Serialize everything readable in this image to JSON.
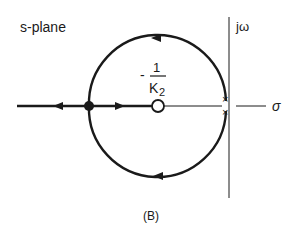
{
  "diagram": {
    "title_label": "s-plane",
    "axis_labels": {
      "imaginary": "jω",
      "real": "σ"
    },
    "zero_label": {
      "sign": "-",
      "numerator": "1",
      "denominator": "K",
      "subscript": "2"
    },
    "caption": "(B)",
    "elements": {
      "double_pole_marker": "×",
      "zero_marker": "○",
      "breakaway_point": "●"
    },
    "colors": {
      "ink": "#1a1a1a",
      "background": "#ffffff"
    }
  }
}
